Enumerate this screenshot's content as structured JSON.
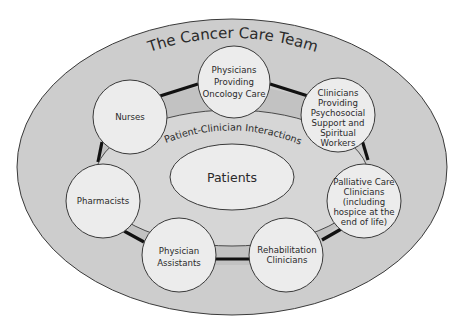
{
  "diagram": {
    "title": "The Cancer Care Team",
    "inner_ring_label": "Patient-Clinician Interactions",
    "center_label": "Patients",
    "colors": {
      "outer_fill": "#cdcdcd",
      "ring_band_fill": "#c2c2c2",
      "inner_fill": "#d6d6d6",
      "node_fill": "#ececec",
      "patients_fill": "#ececec",
      "stroke": "#3a3a3a",
      "connector": "#111111"
    },
    "nodes": [
      {
        "id": "physicians-oncology",
        "lines": [
          "Physicians",
          "Providing",
          "Oncology Care"
        ]
      },
      {
        "id": "psychosocial-spiritual",
        "lines": [
          "Clinicians",
          "Providing",
          "Psychosocial",
          "Support and",
          "Spiritual",
          "Workers"
        ]
      },
      {
        "id": "palliative-care",
        "lines": [
          "Palliative Care",
          "Clinicians",
          "(including",
          "hospice at the",
          "end of life)"
        ]
      },
      {
        "id": "rehabilitation",
        "lines": [
          "Rehabilitation",
          "Clinicians"
        ]
      },
      {
        "id": "physician-assistants",
        "lines": [
          "Physician",
          "Assistants"
        ]
      },
      {
        "id": "pharmacists",
        "lines": [
          "Pharmacists"
        ]
      },
      {
        "id": "nurses",
        "lines": [
          "Nurses"
        ]
      }
    ]
  }
}
